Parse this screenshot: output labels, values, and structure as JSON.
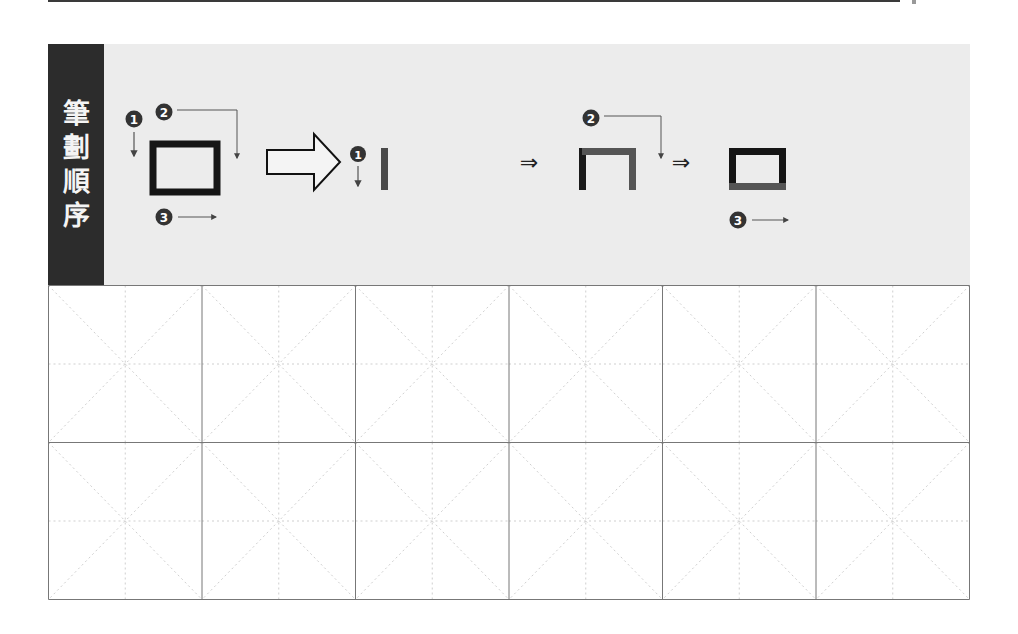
{
  "header": {
    "label_chars": [
      "筆",
      "劃",
      "順",
      "序"
    ],
    "label_text": "筆劃順序"
  },
  "stroke_order": {
    "character": "口",
    "step_numbers": [
      "❶",
      "❷",
      "❸"
    ],
    "implies_arrow": "⇒",
    "steps": [
      {
        "index": 1,
        "description": "vertical stroke down (left side)"
      },
      {
        "index": 2,
        "description": "horizontal-turn-vertical stroke (top and right)"
      },
      {
        "index": 3,
        "description": "horizontal stroke left-to-right (bottom)"
      }
    ]
  },
  "practice_grid": {
    "rows": 2,
    "columns": 6,
    "guide_style": "米字格 dotted cross and diagonals"
  },
  "colors": {
    "label_bg": "#2c2c2c",
    "band_bg": "#ececec",
    "stroke_done": "#1a1a1a",
    "stroke_current": "#555555",
    "grid_line": "#777777",
    "guide_line": "#cfcfcf"
  }
}
